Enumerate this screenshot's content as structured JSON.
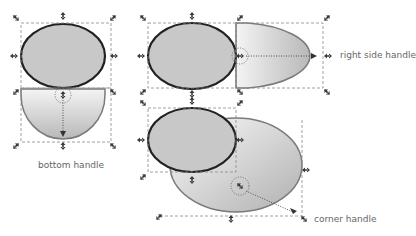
{
  "labels": {
    "bottom": "bottom handle",
    "right": "right side handle",
    "corner": "corner handle"
  },
  "colors": {
    "ellipse_fill": "#c8c8c8",
    "ellipse_stroke": "#222222",
    "ghost_stroke": "#7a7a7a",
    "bbox": "#888888",
    "handle": "#3a3a3a",
    "label": "#666666"
  },
  "examples": [
    {
      "name": "bottom",
      "description": "bottom handle drag stretches ellipse downward"
    },
    {
      "name": "right",
      "description": "right side handle drag stretches ellipse rightward"
    },
    {
      "name": "corner",
      "description": "corner handle drag scales ellipse diagonally"
    }
  ]
}
